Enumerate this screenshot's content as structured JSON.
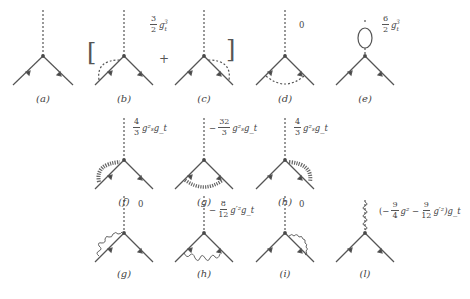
{
  "figure": {
    "type": "Feynman diagrams - top Yukawa vertex corrections",
    "rows": [
      {
        "diagrams": [
          {
            "id": "a",
            "label": "(a)",
            "loop": "none",
            "coefficient": null
          },
          {
            "id": "b",
            "label": "(b)",
            "loop": "scalar on incoming leg",
            "coefficient_group": "bc"
          },
          {
            "id": "c",
            "label": "(c)",
            "loop": "scalar on outgoing leg",
            "coefficient_group": "bc"
          },
          {
            "id": "d",
            "label": "(d)",
            "loop": "scalar exchange between fermions",
            "coefficient": "0"
          },
          {
            "id": "e",
            "label": "(e)",
            "loop": "fermion loop on scalar line",
            "coefficient": "6/2 g_t^3"
          }
        ],
        "bracket_group": {
          "open": "[",
          "plus": "+",
          "close": "]",
          "coef_num": "3",
          "coef_den": "2",
          "coef_var": "g",
          "coef_sub": "t",
          "coef_sup": "3"
        }
      },
      {
        "diagrams": [
          {
            "id": "f",
            "label": "(f)",
            "loop": "gluon on incoming leg",
            "coef_sign": "",
            "coef_num": "4",
            "coef_den": "3",
            "coef_tail": "g_s^2 g_t"
          },
          {
            "id": "g",
            "label": "(g)",
            "loop": "gluon exchange",
            "coef_sign": "−",
            "coef_num": "32",
            "coef_den": "3",
            "coef_tail": "g_s^2 g_t"
          },
          {
            "id": "h",
            "label": "(h)",
            "loop": "gluon on outgoing leg",
            "coef_sign": "",
            "coef_num": "4",
            "coef_den": "3",
            "coef_tail": "g_s^2 g_t"
          }
        ]
      },
      {
        "diagrams": [
          {
            "id": "g2",
            "label": "(g)",
            "loop": "photon on incoming leg",
            "coefficient": "0"
          },
          {
            "id": "h2",
            "label": "(h)",
            "loop": "photon exchange",
            "coef_sign": "−",
            "coef_num": "8",
            "coef_den": "12",
            "coef_tail": "g'^2 g_t"
          },
          {
            "id": "i",
            "label": "(i)",
            "loop": "photon on outgoing leg",
            "coefficient": "0"
          },
          {
            "id": "l",
            "label": "(l)",
            "loop": "gauge boson on scalar line",
            "coefficient": "(−9/4 g^2 − 9/12 g'^2) g_t"
          }
        ]
      }
    ]
  },
  "labels": {
    "a": "(a)",
    "b": "(b)",
    "c": "(c)",
    "d": "(d)",
    "e": "(e)",
    "f": "(f)",
    "g": "(g)",
    "h": "(h)",
    "g2": "(g)",
    "h2": "(h)",
    "i": "(i)",
    "l": "(l)"
  },
  "coefs": {
    "bc": {
      "num": "3",
      "den": "2",
      "var": "g",
      "sub": "t",
      "sup": "3",
      "open": "[",
      "plus": "+",
      "close": "]"
    },
    "d": "0",
    "e": {
      "num": "6",
      "den": "2",
      "var": "g",
      "sub": "t",
      "sup": "3"
    },
    "f": {
      "sign": "",
      "num": "4",
      "den": "3",
      "tail": "g²ₛg_t"
    },
    "g": {
      "sign": "−",
      "num": "32",
      "den": "3",
      "tail": "g²ₛg_t"
    },
    "h": {
      "sign": "",
      "num": "4",
      "den": "3",
      "tail": "g²ₛg_t"
    },
    "g2": "0",
    "h2": {
      "sign": "−",
      "num": "8",
      "den": "12",
      "tail": "g′²g_t"
    },
    "i": "0",
    "l": {
      "open": "(−",
      "n1": "9",
      "d1": "4",
      "t1": "g² −",
      "n2": "9",
      "d2": "12",
      "t2": "g′²)g_t"
    }
  }
}
